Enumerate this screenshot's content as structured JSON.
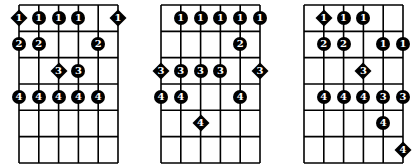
{
  "layout": {
    "strings": 6,
    "frets": 6,
    "string_spacing": 19.8,
    "fret_spacing": 26.33,
    "colors": {
      "line": "#000000",
      "dot": "#000000",
      "text": "#ffffff",
      "background": "#ffffff"
    }
  },
  "diagrams": [
    {
      "left": 19,
      "notes": [
        {
          "string": 1,
          "fret": 1,
          "finger": "1",
          "shape": "diamond"
        },
        {
          "string": 2,
          "fret": 1,
          "finger": "1",
          "shape": "dot"
        },
        {
          "string": 3,
          "fret": 1,
          "finger": "1",
          "shape": "dot"
        },
        {
          "string": 4,
          "fret": 1,
          "finger": "1",
          "shape": "dot"
        },
        {
          "string": 6,
          "fret": 1,
          "finger": "1",
          "shape": "diamond"
        },
        {
          "string": 1,
          "fret": 2,
          "finger": "2",
          "shape": "dot"
        },
        {
          "string": 2,
          "fret": 2,
          "finger": "2",
          "shape": "dot"
        },
        {
          "string": 5,
          "fret": 2,
          "finger": "2",
          "shape": "dot"
        },
        {
          "string": 3,
          "fret": 3,
          "finger": "3",
          "shape": "diamond"
        },
        {
          "string": 4,
          "fret": 3,
          "finger": "3",
          "shape": "dot"
        },
        {
          "string": 1,
          "fret": 4,
          "finger": "4",
          "shape": "dot"
        },
        {
          "string": 2,
          "fret": 4,
          "finger": "4",
          "shape": "dot"
        },
        {
          "string": 3,
          "fret": 4,
          "finger": "4",
          "shape": "dot"
        },
        {
          "string": 4,
          "fret": 4,
          "finger": "4",
          "shape": "dot"
        },
        {
          "string": 5,
          "fret": 4,
          "finger": "4",
          "shape": "dot"
        }
      ]
    },
    {
      "left": 161,
      "notes": [
        {
          "string": 2,
          "fret": 1,
          "finger": "1",
          "shape": "dot"
        },
        {
          "string": 3,
          "fret": 1,
          "finger": "1",
          "shape": "dot"
        },
        {
          "string": 4,
          "fret": 1,
          "finger": "1",
          "shape": "dot"
        },
        {
          "string": 5,
          "fret": 1,
          "finger": "1",
          "shape": "dot"
        },
        {
          "string": 6,
          "fret": 1,
          "finger": "1",
          "shape": "dot"
        },
        {
          "string": 5,
          "fret": 2,
          "finger": "2",
          "shape": "dot"
        },
        {
          "string": 1,
          "fret": 3,
          "finger": "3",
          "shape": "diamond"
        },
        {
          "string": 2,
          "fret": 3,
          "finger": "3",
          "shape": "dot"
        },
        {
          "string": 3,
          "fret": 3,
          "finger": "3",
          "shape": "dot"
        },
        {
          "string": 4,
          "fret": 3,
          "finger": "3",
          "shape": "dot"
        },
        {
          "string": 6,
          "fret": 3,
          "finger": "3",
          "shape": "diamond"
        },
        {
          "string": 1,
          "fret": 4,
          "finger": "4",
          "shape": "dot"
        },
        {
          "string": 2,
          "fret": 4,
          "finger": "4",
          "shape": "dot"
        },
        {
          "string": 5,
          "fret": 4,
          "finger": "4",
          "shape": "dot"
        },
        {
          "string": 3,
          "fret": 5,
          "finger": "4",
          "shape": "diamond"
        }
      ]
    },
    {
      "left": 304,
      "notes": [
        {
          "string": 2,
          "fret": 1,
          "finger": "1",
          "shape": "diamond"
        },
        {
          "string": 3,
          "fret": 1,
          "finger": "1",
          "shape": "dot"
        },
        {
          "string": 4,
          "fret": 1,
          "finger": "1",
          "shape": "dot"
        },
        {
          "string": 2,
          "fret": 2,
          "finger": "2",
          "shape": "dot"
        },
        {
          "string": 3,
          "fret": 2,
          "finger": "2",
          "shape": "dot"
        },
        {
          "string": 5,
          "fret": 2,
          "finger": "1",
          "shape": "dot"
        },
        {
          "string": 6,
          "fret": 2,
          "finger": "1",
          "shape": "dot"
        },
        {
          "string": 4,
          "fret": 3,
          "finger": "3",
          "shape": "diamond"
        },
        {
          "string": 2,
          "fret": 4,
          "finger": "4",
          "shape": "dot"
        },
        {
          "string": 3,
          "fret": 4,
          "finger": "4",
          "shape": "dot"
        },
        {
          "string": 4,
          "fret": 4,
          "finger": "4",
          "shape": "dot"
        },
        {
          "string": 5,
          "fret": 4,
          "finger": "3",
          "shape": "dot"
        },
        {
          "string": 6,
          "fret": 4,
          "finger": "3",
          "shape": "dot"
        },
        {
          "string": 5,
          "fret": 5,
          "finger": "4",
          "shape": "dot"
        },
        {
          "string": 6,
          "fret": 6,
          "finger": "4",
          "shape": "diamond"
        }
      ]
    }
  ]
}
